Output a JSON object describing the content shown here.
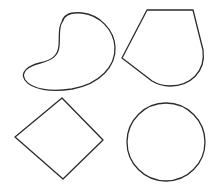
{
  "diagram": {
    "background": "#ffffff",
    "stroke_color": "#2b2b2b",
    "shapes": [
      {
        "id": "blob",
        "type": "freeform",
        "position": "top-left"
      },
      {
        "id": "pentagon",
        "type": "pentagon-rounded",
        "position": "top-right"
      },
      {
        "id": "diamond",
        "type": "diamond",
        "position": "bottom-left"
      },
      {
        "id": "circle",
        "type": "circle",
        "position": "bottom-right"
      }
    ]
  }
}
